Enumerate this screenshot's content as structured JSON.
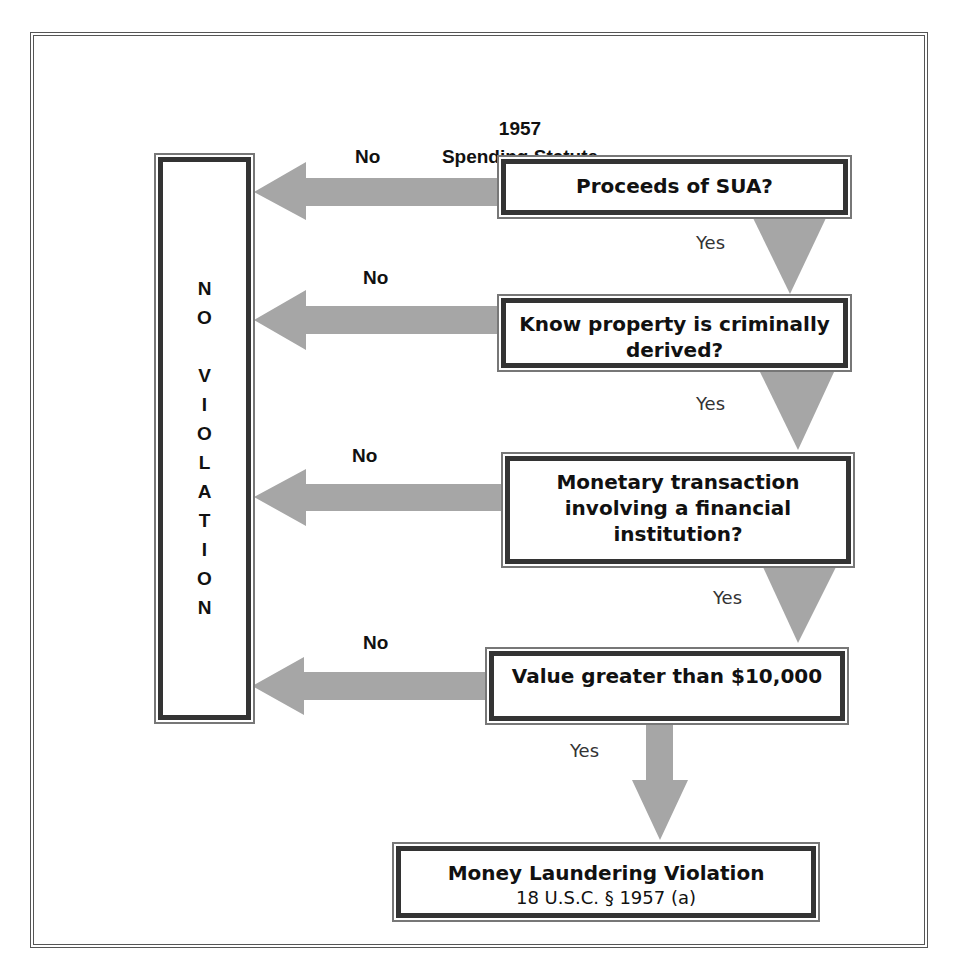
{
  "header": {
    "title_line1": "1957",
    "title_line2": "Spending Statute"
  },
  "no_violation_box": {
    "letters": [
      "N",
      "O",
      "",
      "V",
      "I",
      "O",
      "L",
      "A",
      "T",
      "I",
      "O",
      "N"
    ],
    "text": "NO VIOLATION"
  },
  "decisions": [
    {
      "question": "Proceeds of SUA?",
      "no_label": "No",
      "yes_label": "Yes"
    },
    {
      "question_line1": "Know property is criminally",
      "question_line2": "derived?",
      "no_label": "No",
      "yes_label": "Yes"
    },
    {
      "question_line1": "Monetary transaction",
      "question_line2": "involving a financial",
      "question_line3": "institution?",
      "no_label": "No",
      "yes_label": "Yes"
    },
    {
      "question": "Value greater than $10,000",
      "no_label": "No",
      "yes_label": "Yes"
    }
  ],
  "result_box": {
    "title": "Money Laundering Violation",
    "citation": "18 U.S.C. § 1957 (a)"
  },
  "colors": {
    "arrow_fill": "#a6a6a6",
    "box_border_dark": "#333333",
    "box_border_light": "#777777",
    "text": "#111111"
  }
}
